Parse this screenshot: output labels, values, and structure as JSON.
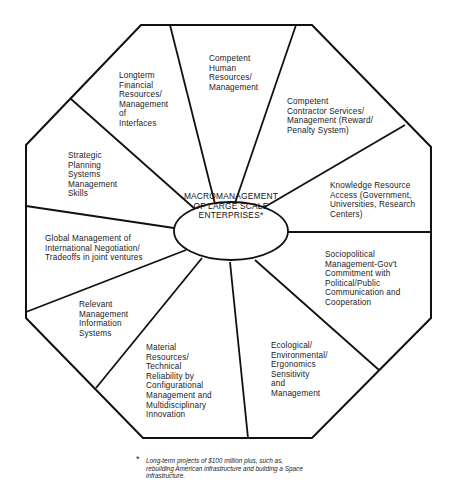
{
  "diagram": {
    "title": "MACROMANAGEMENT\nOF LARGE SCALE\nENTERPRISES*",
    "segments": [
      {
        "id": "human-resources",
        "label": "Competent\nHuman\nResources/\nManagement"
      },
      {
        "id": "contractor-services",
        "label": "Competent\nContractor Services/\nManagement (Reward/\nPenalty System)"
      },
      {
        "id": "knowledge-resource",
        "label": "Knowledge Resource\nAccess (Government,\nUniversities, Research\nCenters)"
      },
      {
        "id": "sociopolitical",
        "label": "Sociopolitical\nManagement-Gov't\nCommitment with\nPolitical/Public\nCommunication and\nCooperation"
      },
      {
        "id": "ecological",
        "label": "Ecological/\nEnvironmental/\nErgonomics\nSensitivity\nand\nManagement"
      },
      {
        "id": "material-resources",
        "label": "Material\nResources/\nTechnical\nReliability by\nConfigurational\nManagement and\nMultidisciplinary\nInnovation"
      },
      {
        "id": "information-systems",
        "label": "Relevant\nManagement\nInformation\nSystems"
      },
      {
        "id": "global-management",
        "label": "Global Management of\nInternational Negotiation/\nTradeoffs in joint ventures"
      },
      {
        "id": "strategic-planning",
        "label": "Strategic\nPlanning\nSystems\nManagement\nSkills"
      },
      {
        "id": "financial-resources",
        "label": "Longterm\nFinancial\nResources/\nManagement\nof\nInterfaces"
      }
    ],
    "footnote": {
      "marker": "*",
      "text": "Long-term projects of $100 million plus, such as,\nrebuilding American infrastructure and building a Space\ninfrastructure."
    },
    "colors": {
      "line": "#111111",
      "background": "#ffffff"
    }
  }
}
